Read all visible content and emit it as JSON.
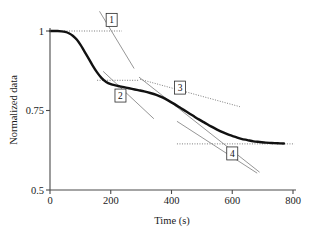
{
  "chart_data": {
    "type": "line",
    "title": "",
    "xlabel": "Time (s)",
    "ylabel": "Normalized data",
    "xlim": [
      0,
      800
    ],
    "ylim": [
      0.5,
      1.0
    ],
    "xticks": [
      0,
      200,
      400,
      600,
      800
    ],
    "xtick_labels": [
      "0",
      "200",
      "400",
      "600",
      "800"
    ],
    "yticks": [
      0.5,
      0.75,
      1.0
    ],
    "ytick_labels": [
      "0.5",
      "0.75",
      "1"
    ],
    "grid": false,
    "legend": null,
    "series": [
      {
        "name": "normalized data",
        "color": "#111111",
        "x": [
          0,
          12,
          25,
          38,
          50,
          62,
          75,
          88,
          100,
          112,
          125,
          140,
          155,
          170,
          185,
          200,
          215,
          230,
          250,
          270,
          290,
          310,
          330,
          350,
          370,
          390,
          410,
          430,
          450,
          470,
          490,
          510,
          530,
          550,
          570,
          590,
          610,
          630,
          650,
          670,
          690,
          710,
          730,
          750,
          770
        ],
        "y": [
          1.0,
          1.0,
          1.0,
          0.999,
          0.997,
          0.993,
          0.985,
          0.973,
          0.957,
          0.938,
          0.917,
          0.892,
          0.87,
          0.852,
          0.84,
          0.833,
          0.829,
          0.826,
          0.822,
          0.818,
          0.814,
          0.81,
          0.805,
          0.799,
          0.791,
          0.781,
          0.77,
          0.758,
          0.746,
          0.734,
          0.722,
          0.711,
          0.7,
          0.69,
          0.681,
          0.673,
          0.667,
          0.661,
          0.657,
          0.653,
          0.651,
          0.649,
          0.648,
          0.647,
          0.646
        ]
      }
    ],
    "annotations": [
      {
        "id": "1",
        "label": "1",
        "label_x": 203,
        "label_y": 1.035,
        "baseline": {
          "kind": "dotted-horizontal",
          "y": 1.0,
          "x_start": 5,
          "x_end": 237
        },
        "tangent": {
          "kind": "solid",
          "x_start": 163,
          "y_start": 1.062,
          "x_end": 277,
          "y_end": 0.882
        }
      },
      {
        "id": "2",
        "label": "2",
        "label_x": 232,
        "label_y": 0.797,
        "baseline": {
          "kind": "dotted-horizontal",
          "y": 0.845,
          "x_start": 155,
          "x_end": 290
        },
        "tangent": {
          "kind": "solid",
          "x_start": 175,
          "y_start": 0.873,
          "x_end": 342,
          "y_end": 0.724
        }
      },
      {
        "id": "3",
        "label": "3",
        "label_x": 428,
        "label_y": 0.822,
        "baseline": null,
        "tangent": {
          "kind": "solid",
          "x_start": 293,
          "y_start": 0.855,
          "x_end": 690,
          "y_end": 0.556
        },
        "tangent2": {
          "kind": "dotted",
          "x_start": 297,
          "y_start": 0.848,
          "x_end": 625,
          "y_end": 0.762
        }
      },
      {
        "id": "4",
        "label": "4",
        "label_x": 600,
        "label_y": 0.615,
        "baseline": {
          "kind": "dotted-horizontal",
          "y": 0.645,
          "x_start": 418,
          "x_end": 805
        },
        "tangent": {
          "kind": "solid",
          "x_start": 418,
          "y_start": 0.716,
          "x_end": 682,
          "y_end": 0.553
        }
      }
    ]
  }
}
